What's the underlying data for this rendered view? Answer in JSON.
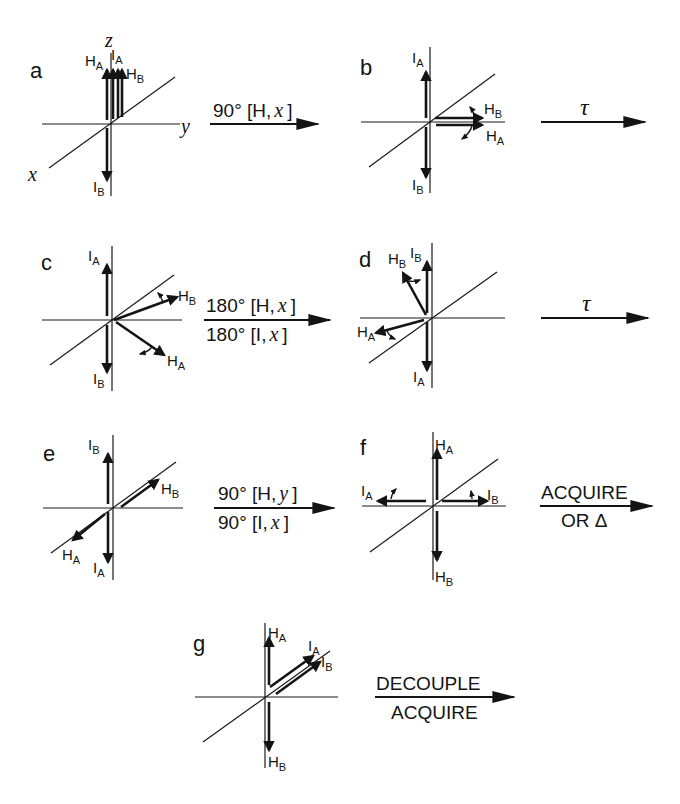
{
  "figure": {
    "axes": {
      "x": "x",
      "y": "y",
      "z": "z"
    },
    "panels": [
      {
        "id": "a",
        "letter": "a",
        "vectors": [
          "HA",
          "IA",
          "HB",
          "IB"
        ]
      },
      {
        "id": "b",
        "letter": "b",
        "vectors": [
          "IA",
          "HB",
          "HA",
          "IB"
        ]
      },
      {
        "id": "c",
        "letter": "c",
        "vectors": [
          "IA",
          "HB",
          "HA",
          "IB"
        ]
      },
      {
        "id": "d",
        "letter": "d",
        "vectors": [
          "HB",
          "IB",
          "HA",
          "IA"
        ]
      },
      {
        "id": "e",
        "letter": "e",
        "vectors": [
          "IB",
          "HB",
          "HA",
          "IA"
        ]
      },
      {
        "id": "f",
        "letter": "f",
        "vectors": [
          "HA",
          "IA",
          "IB",
          "HB"
        ]
      },
      {
        "id": "g",
        "letter": "g",
        "vectors": [
          "HA",
          "IA",
          "IB",
          "HB"
        ]
      }
    ],
    "labels": {
      "H": "H",
      "I": "I",
      "A": "A",
      "B": "B"
    },
    "transitions": [
      {
        "from": "a",
        "to": "b",
        "top": "90° [H, x ]",
        "top_pre": "90° [H,",
        "top_var": "x",
        "top_post": "]",
        "bottom": ""
      },
      {
        "from": "b",
        "to": "c",
        "top": "τ",
        "bottom": ""
      },
      {
        "from": "c",
        "to": "d",
        "top_pre": "180° [H,",
        "top_var": "x",
        "top_post": "]",
        "bottom_pre": "180° [I,",
        "bottom_var": "x",
        "bottom_post": "]"
      },
      {
        "from": "d",
        "to": "e",
        "top": "τ",
        "bottom": ""
      },
      {
        "from": "e",
        "to": "f",
        "top_pre": "90° [H,",
        "top_var": "y",
        "top_post": "]",
        "bottom_pre": "90° [I,",
        "bottom_var": "x",
        "bottom_post": "]"
      },
      {
        "from": "f",
        "to": "g",
        "top": "ACQUIRE",
        "bottom": "OR Δ"
      },
      {
        "from": "g",
        "to": "end",
        "top": "DECOUPLE",
        "bottom": "ACQUIRE"
      }
    ]
  }
}
